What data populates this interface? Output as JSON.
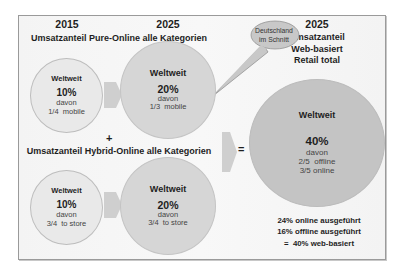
{
  "headers": {
    "year_left": "2015",
    "year_mid": "2025",
    "year_right": "2025",
    "pure_online": "Umsatzanteil Pure-Online alle Kategorien",
    "hybrid_online": "Umsatzanteil Hybrid-Online alle Kategorien",
    "right_title": [
      "Umsatzanteil",
      "Web-basiert",
      "Retail total"
    ]
  },
  "callout": {
    "lines": [
      "Deutschland",
      "im Schnitt"
    ]
  },
  "operators": {
    "plus": "+",
    "equals": "="
  },
  "circles": {
    "pure_2015": {
      "label": "Weltweit",
      "pct": "10%",
      "davon": "davon",
      "detail": "1/4  mobile"
    },
    "pure_2025": {
      "label": "Weltweit",
      "pct": "20%",
      "davon": "davon",
      "detail": "1/3  mobile"
    },
    "hybrid_2015": {
      "label": "Weltweit",
      "pct": "10%",
      "davon": "davon",
      "detail": "3/4  to store"
    },
    "hybrid_2025": {
      "label": "Weltweit",
      "pct": "20%",
      "davon": "davon",
      "detail": "3/4  to store"
    },
    "total_2025": {
      "label": "Weltweit",
      "pct": "40%",
      "davon": "davon",
      "detail1": "2/5  offline",
      "detail2": "3/5 online"
    }
  },
  "summary": [
    "24% online ausgeführt",
    "16% offline ausgeführt",
    "=  40% web-basiert"
  ],
  "colors": {
    "small_circle": "#e9e9e9",
    "mid_circle": "#d6d6d6",
    "big_circle": "#c4c4c4",
    "chevron": "#cfcfcf",
    "bubble": "#c8c8c8"
  }
}
